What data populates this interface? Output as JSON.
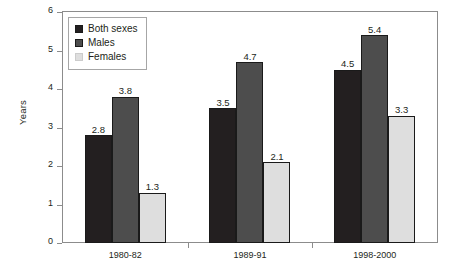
{
  "chart_data": {
    "type": "bar",
    "title": "",
    "xlabel": "",
    "ylabel": "Years",
    "categories": [
      "1980-82",
      "1989-91",
      "1998-2000"
    ],
    "series": [
      {
        "name": "Both sexes",
        "color": "#231f20",
        "values": [
          2.8,
          3.5,
          4.5
        ]
      },
      {
        "name": "Males",
        "color": "#4d4d4d",
        "values": [
          3.8,
          4.7,
          5.4
        ]
      },
      {
        "name": "Females",
        "color": "#dedede",
        "values": [
          1.3,
          2.1,
          3.3
        ]
      }
    ],
    "ylim": [
      0,
      6
    ],
    "yticks": [
      0,
      1,
      2,
      3,
      4,
      5,
      6
    ],
    "ytick_labels": [
      "0",
      "1",
      "2",
      "3",
      "4",
      "5",
      "6"
    ],
    "grid": false,
    "legend_position": "top-left",
    "data_labels": true
  },
  "legend": {
    "items": [
      {
        "label": "Both sexes",
        "swatch": "both"
      },
      {
        "label": "Males",
        "swatch": "males"
      },
      {
        "label": "Females",
        "swatch": "females"
      }
    ]
  }
}
